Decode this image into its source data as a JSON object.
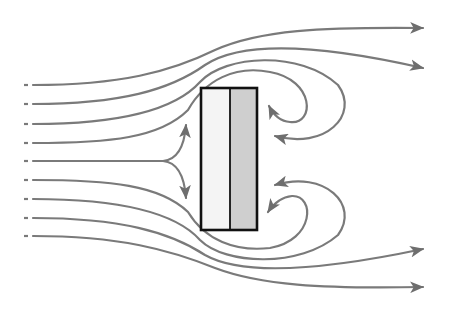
{
  "diagram": {
    "type": "flow-around-plate",
    "colors": {
      "background": "#ffffff",
      "streamline": "#7a7a7a",
      "arrowhead": "#6e6e6e",
      "plate_outline": "#111111",
      "plate_front_fill": "#f4f4f4",
      "plate_back_fill": "#cfcfcf"
    },
    "plate": {
      "x": 201,
      "y": 88,
      "width": 56,
      "height": 142,
      "divider_x": 230
    },
    "inflow_lines_y": [
      85,
      104,
      124,
      143,
      161,
      180,
      199,
      218,
      236
    ],
    "inflow_start_x": 25,
    "outflow_arrows": [
      {
        "label": "upper-outer",
        "tip": [
          423,
          28
        ]
      },
      {
        "label": "upper-inner",
        "tip": [
          423,
          68
        ]
      },
      {
        "label": "lower-inner",
        "tip": [
          423,
          249
        ]
      },
      {
        "label": "lower-outer",
        "tip": [
          423,
          287
        ]
      }
    ],
    "recirculation_arrows": [
      {
        "label": "upper-small-eddy",
        "tip": [
          268,
          103
        ]
      },
      {
        "label": "upper-large-eddy",
        "tip": [
          271,
          133
        ]
      },
      {
        "label": "lower-large-eddy",
        "tip": [
          271,
          184
        ]
      },
      {
        "label": "lower-small-eddy",
        "tip": [
          266,
          215
        ]
      }
    ],
    "stagnation_arrows": [
      {
        "label": "deflect-up",
        "tip": [
          186,
          123
        ]
      },
      {
        "label": "deflect-down",
        "tip": [
          186,
          200
        ]
      }
    ]
  }
}
